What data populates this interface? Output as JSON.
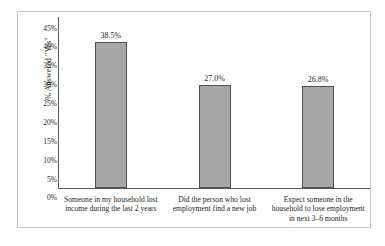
{
  "chart_data": {
    "type": "bar",
    "title": "",
    "xlabel": "",
    "ylabel": "% Answered \"Yes\"",
    "ylim": [
      0,
      45
    ],
    "grid": false,
    "legend": "none",
    "categories": [
      "Someone in my household lost income during the last 2 years",
      "Did the person who lost employment find a new job",
      "Expect someone in the household to lose employment in next 3–6 months"
    ],
    "values": [
      38.5,
      27.0,
      26.8
    ],
    "value_labels": [
      "38.5%",
      "27.0%",
      "26.8%"
    ],
    "ytick_values": [
      45,
      40,
      35,
      30,
      25,
      20,
      15,
      10,
      5,
      0
    ],
    "ytick_labels": [
      "45%",
      "40%",
      "35%",
      "30%",
      "25%",
      "20%",
      "15%",
      "10%",
      "5%",
      "0%"
    ],
    "colors": {
      "bar_fill": "#a7a7a7",
      "bar_border": "#4f4f4f",
      "axis": "#5a5a5a",
      "frame": "#c9c9c9",
      "text": "#231f20",
      "background": "#ffffff"
    }
  }
}
